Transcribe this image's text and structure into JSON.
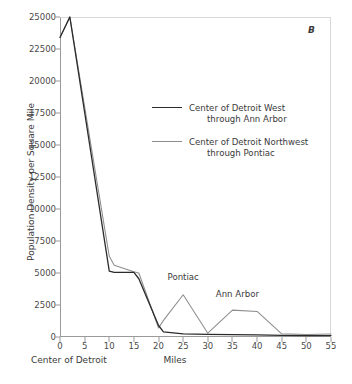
{
  "panel": {
    "tag": "B"
  },
  "legend": {
    "entries": [
      {
        "style": "dark",
        "line1": "Center of Detroit West",
        "line2": "through Ann Arbor"
      },
      {
        "style": "gray",
        "line1": "Center of Detroit Northwest",
        "line2": "through Pontiac"
      }
    ]
  },
  "axes": {
    "origin_label": "Center of Detroit"
  },
  "chart_data": {
    "type": "line",
    "title": "",
    "xlabel": "Miles",
    "ylabel": "Population Density per Square Mile",
    "xlim": [
      0,
      55
    ],
    "ylim": [
      0,
      25000
    ],
    "xticks": [
      0,
      5,
      10,
      15,
      20,
      25,
      30,
      35,
      40,
      45,
      50,
      55
    ],
    "xticklabels": [
      "0",
      "5",
      "10",
      "15",
      "20",
      "25",
      "30",
      "35",
      "40",
      "45",
      "50",
      "55"
    ],
    "yticks": [
      0,
      2500,
      5000,
      7500,
      10000,
      12500,
      15000,
      17500,
      20000,
      22500,
      25000
    ],
    "yticklabels": [
      "0",
      "2500",
      "5000",
      "7500",
      "10000",
      "12500",
      "15000",
      "17500",
      "20000",
      "22500",
      "25000"
    ],
    "grid": false,
    "legend_position": "upper center",
    "series": [
      {
        "name": "Center of Detroit West through Ann Arbor",
        "color": "#2b2b2b",
        "x": [
          0,
          2,
          10,
          11,
          15,
          16,
          20,
          21,
          25,
          30,
          35,
          40,
          45,
          50,
          55
        ],
        "y": [
          23400,
          25000,
          5150,
          5050,
          5050,
          4550,
          900,
          400,
          250,
          200,
          180,
          170,
          120,
          110,
          110
        ]
      },
      {
        "name": "Center of Detroit Northwest through Pontiac",
        "color": "#8d8d8d",
        "x": [
          0,
          2,
          10,
          11,
          15,
          16,
          20,
          21,
          25,
          30,
          35,
          40,
          45,
          50,
          55
        ],
        "y": [
          23400,
          25000,
          6300,
          5600,
          5100,
          5000,
          700,
          1300,
          3300,
          300,
          2100,
          2000,
          250,
          200,
          230
        ]
      }
    ],
    "annotations": [
      {
        "text": "Pontiac",
        "x": 25,
        "y": 4600
      },
      {
        "text": "Ann Arbor",
        "x": 36,
        "y": 3300
      }
    ]
  }
}
